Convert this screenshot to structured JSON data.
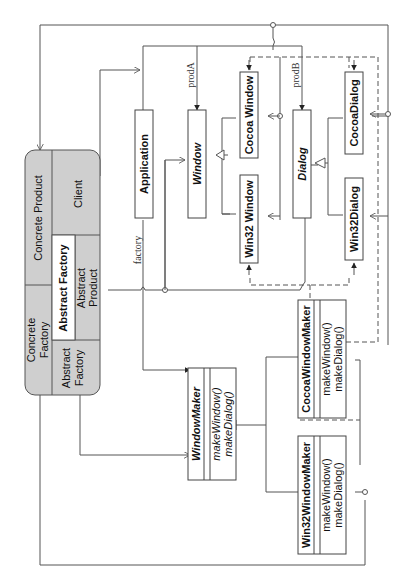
{
  "diagram": {
    "orientation": "rotated-90-ccw",
    "pattern_legend": {
      "concrete_product": "Concrete Product",
      "concrete_factory_1": "Concrete",
      "concrete_factory_2": "Factory",
      "abstract_factory_title": "Abstract Factory",
      "client": "Client",
      "abstract_product_1": "Abstract",
      "abstract_product_2": "Product",
      "abstract_factory_1": "Abstract",
      "abstract_factory_2": "Factory"
    },
    "classes": {
      "application": "Application",
      "window": "Window",
      "cocoa_window": "Cocoa Window",
      "win32_window": "Win32 Window",
      "dialog": "Dialog",
      "cocoa_dialog": "CocoaDialog",
      "win32_dialog": "Win32Dialog",
      "window_maker": {
        "name": "WindowMaker",
        "methods": [
          "makeWindow()",
          "makeDialog()"
        ]
      },
      "cocoa_window_maker": {
        "name": "CocoaWindowMaker",
        "methods": [
          "makeWindow()",
          "makeDialog()"
        ]
      },
      "win32_window_maker": {
        "name": "Win32WindowMaker",
        "methods": [
          "makeWindow()",
          "makeDialog()"
        ]
      }
    },
    "roles": {
      "factory": "factory",
      "prodA": "prodA",
      "prodB": "prodB"
    },
    "colors": {
      "line": "#555555",
      "shade": "#cfcfcf",
      "box_border": "#444444"
    }
  }
}
